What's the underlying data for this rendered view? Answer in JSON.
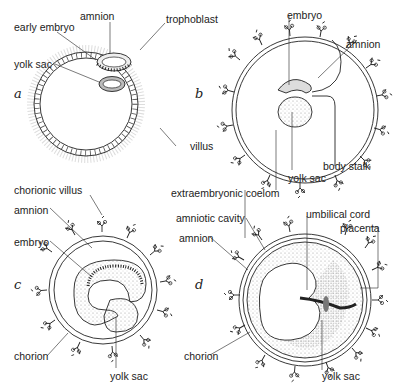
{
  "panels": {
    "a": {
      "letter": "a",
      "labels": {
        "early_embryo": "early embryo",
        "amnion": "amnion",
        "trophoblast": "trophoblast",
        "yolk_sac": "yolk sac",
        "villus": "villus"
      }
    },
    "b": {
      "letter": "b",
      "labels": {
        "embryo": "embryo",
        "amnion": "amnion",
        "body_stalk": "body stalk",
        "yolk_sac": "yolk sac",
        "extraembryonic_coelom": "extraembryonic coelom"
      }
    },
    "c": {
      "letter": "c",
      "labels": {
        "chorionic_villus": "chorionic villus",
        "amnion": "amnion",
        "embryo": "embryo",
        "chorion": "chorion",
        "yolk_sac": "yolk sac"
      }
    },
    "d": {
      "letter": "d",
      "labels": {
        "amniotic_cavity": "amniotic cavity",
        "umbilical_cord": "umbilical cord",
        "placenta": "placenta",
        "amnion": "amnion",
        "chorion": "chorion",
        "yolk_sac": "yolk sac"
      }
    }
  },
  "colors": {
    "ink": "#222222",
    "stipple": "#9a9a9a",
    "background": "#ffffff"
  }
}
